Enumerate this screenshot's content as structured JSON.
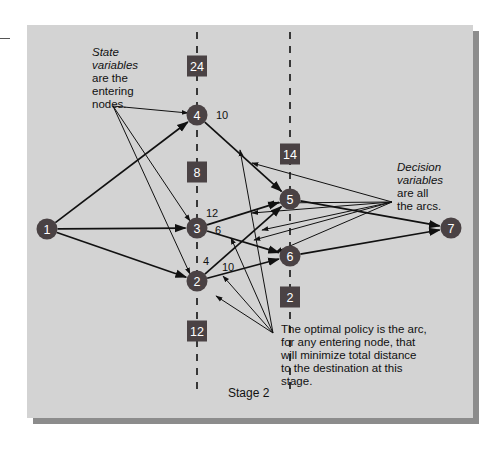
{
  "colors": {
    "panel": "#d3d3d3",
    "panel_shadow": "#8c8c8c",
    "node_fill": "#4a4244",
    "box_fill": "#4a4244",
    "line": "#111111",
    "label_text": "#ffffff"
  },
  "stage_lines": [
    {
      "x": 197,
      "y1": 32,
      "y2": 395
    },
    {
      "x": 290,
      "y1": 32,
      "y2": 395
    }
  ],
  "stage_label": {
    "text": "Stage 2",
    "x": 228,
    "y": 397
  },
  "nodes": [
    {
      "id": "1",
      "label": "1",
      "x": 47,
      "y": 229
    },
    {
      "id": "2",
      "label": "2",
      "x": 197,
      "y": 281
    },
    {
      "id": "3",
      "label": "3",
      "x": 197,
      "y": 228
    },
    {
      "id": "4",
      "label": "4",
      "x": 197,
      "y": 115
    },
    {
      "id": "5",
      "label": "5",
      "x": 290,
      "y": 199
    },
    {
      "id": "6",
      "label": "6",
      "x": 290,
      "y": 256
    },
    {
      "id": "7",
      "label": "7",
      "x": 451,
      "y": 228
    }
  ],
  "boxes": [
    {
      "label": "24",
      "x": 197,
      "y": 66
    },
    {
      "label": "8",
      "x": 197,
      "y": 172
    },
    {
      "label": "12",
      "x": 197,
      "y": 331
    },
    {
      "label": "14",
      "x": 290,
      "y": 154
    },
    {
      "label": "2",
      "x": 290,
      "y": 297
    }
  ],
  "arcs": [
    {
      "from": "1",
      "to": "4"
    },
    {
      "from": "1",
      "to": "3"
    },
    {
      "from": "1",
      "to": "2"
    },
    {
      "from": "4",
      "to": "5"
    },
    {
      "from": "3",
      "to": "5"
    },
    {
      "from": "3",
      "to": "6"
    },
    {
      "from": "2",
      "to": "5"
    },
    {
      "from": "2",
      "to": "6"
    },
    {
      "from": "5",
      "to": "7"
    },
    {
      "from": "6",
      "to": "7"
    }
  ],
  "arc_labels": [
    {
      "text": "10",
      "x": 216,
      "y": 119
    },
    {
      "text": "12",
      "x": 206,
      "y": 217
    },
    {
      "text": "6",
      "x": 215,
      "y": 234
    },
    {
      "text": "4",
      "x": 203,
      "y": 265
    },
    {
      "text": "10",
      "x": 222,
      "y": 271
    }
  ],
  "annotations": {
    "state_variables": {
      "lines": [
        "State",
        "variables",
        "are the",
        "entering",
        "nodes."
      ],
      "italic_lines": 2,
      "x": 92,
      "y": 46,
      "apex": {
        "x": 113,
        "y": 106
      },
      "targets": [
        {
          "x": 188,
          "y": 113
        },
        {
          "x": 190,
          "y": 221
        },
        {
          "x": 190,
          "y": 274
        }
      ]
    },
    "decision_variables": {
      "lines": [
        "Decision",
        "variables",
        "are all",
        "the arcs."
      ],
      "italic_lines": 2,
      "x": 397,
      "y": 161,
      "apex": {
        "x": 392,
        "y": 202
      },
      "targets": [
        {
          "x": 252,
          "y": 163
        },
        {
          "x": 268,
          "y": 203
        },
        {
          "x": 252,
          "y": 213
        },
        {
          "x": 262,
          "y": 230
        },
        {
          "x": 254,
          "y": 240
        },
        {
          "x": 276,
          "y": 252
        }
      ]
    },
    "optimal_policy": {
      "lines": [
        "The optimal policy is the arc,",
        "for any entering node, that",
        "will minimize total distance",
        "to the destination at this",
        "stage."
      ],
      "x": 281,
      "y": 323,
      "apex": {
        "x": 273,
        "y": 333
      },
      "targets": [
        {
          "x": 240,
          "y": 150
        },
        {
          "x": 231,
          "y": 238
        },
        {
          "x": 223,
          "y": 276
        },
        {
          "x": 216,
          "y": 296
        }
      ]
    }
  }
}
